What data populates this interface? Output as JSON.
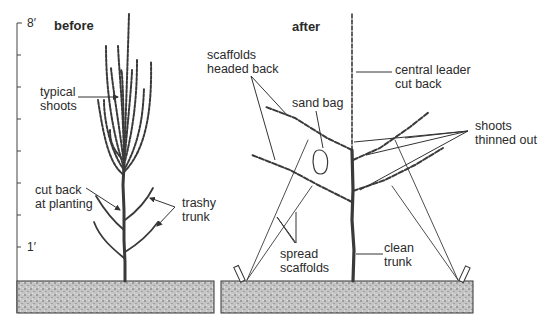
{
  "figure": {
    "panels": [
      {
        "title": "before",
        "labels": {
          "typical_shoots": [
            "typical",
            "shoots"
          ],
          "cut_back": [
            "cut back",
            "at planting"
          ],
          "trashy_trunk": [
            "trashy",
            "trunk"
          ]
        }
      },
      {
        "title": "after",
        "labels": {
          "scaffolds_headed_back": [
            "scaffolds",
            "headed back"
          ],
          "sand_bag": [
            "sand bag"
          ],
          "central_leader": [
            "central leader",
            "cut back"
          ],
          "shoots_thinned": [
            "shoots",
            "thinned out"
          ],
          "spread_scaffolds": [
            "spread",
            "scaffolds"
          ],
          "clean_trunk": [
            "clean",
            "trunk"
          ]
        }
      }
    ],
    "height_scale": {
      "top_label": "8′",
      "bottom_label": "1′",
      "ticks": 8
    },
    "colors": {
      "line": "#333333",
      "ground_fill": "#bdbdbd",
      "background": "#ffffff"
    }
  }
}
